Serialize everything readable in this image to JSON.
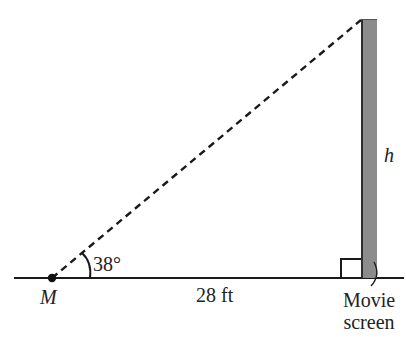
{
  "diagram": {
    "type": "right-triangle-word-problem",
    "labels": {
      "point": "M",
      "angle": "38°",
      "distance": "28 ft",
      "height": "h",
      "screen_line1": "Movie",
      "screen_line2": "screen"
    },
    "values": {
      "angle_degrees": 38,
      "horizontal_distance_ft": 28,
      "unknown": "h"
    },
    "colors": {
      "line": "#1a1a1a",
      "screen_fill": "#8c8c8c",
      "screen_edge": "#2e2e2e",
      "text": "#222222"
    }
  }
}
